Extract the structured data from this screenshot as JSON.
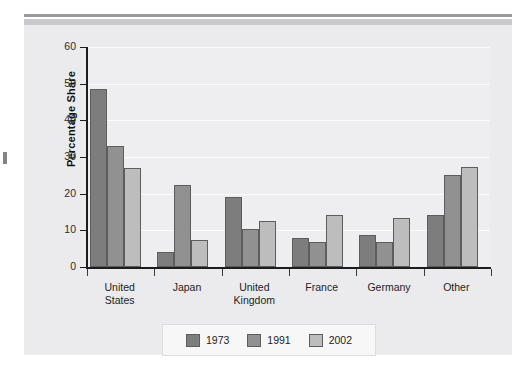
{
  "figure": {
    "top_rule_color": "#9a9a9a",
    "top_band_color": "#c9c9cd",
    "panel_bg": "#ebebed",
    "plot_bg": "#eeeef0"
  },
  "chart_data": {
    "type": "bar",
    "title": "",
    "xlabel": "",
    "ylabel": "Percentage Share",
    "ylim": [
      0,
      60
    ],
    "yticks": [
      0,
      10,
      20,
      30,
      40,
      50,
      60
    ],
    "grid": true,
    "legend_position": "bottom",
    "categories": [
      "United States",
      "Japan",
      "United Kingdom",
      "France",
      "Germany",
      "Other"
    ],
    "category_label_lines": [
      [
        "United",
        "States"
      ],
      [
        "Japan"
      ],
      [
        "United",
        "Kingdom"
      ],
      [
        "France"
      ],
      [
        "Germany"
      ],
      [
        "Other"
      ]
    ],
    "series": [
      {
        "name": "1973",
        "color": "#7d7d7d",
        "values": [
          48.5,
          4.1,
          19.2,
          7.8,
          8.6,
          14.2
        ]
      },
      {
        "name": "1991",
        "color": "#919191",
        "values": [
          33.0,
          22.5,
          10.5,
          6.8,
          6.8,
          25.0
        ]
      },
      {
        "name": "2002",
        "color": "#bdbdbd",
        "values": [
          27.0,
          7.5,
          12.5,
          14.3,
          13.5,
          27.2
        ]
      }
    ]
  },
  "legend": {
    "items": [
      {
        "label": "1973",
        "color": "#7d7d7d"
      },
      {
        "label": "1991",
        "color": "#919191"
      },
      {
        "label": "2002",
        "color": "#bdbdbd"
      }
    ]
  }
}
